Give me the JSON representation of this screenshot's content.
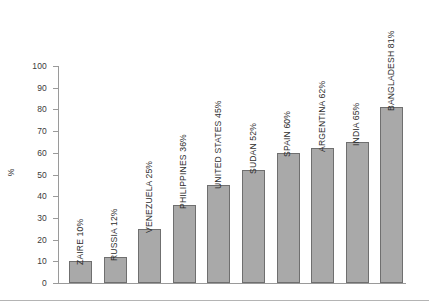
{
  "chart_data": {
    "type": "bar",
    "title": "",
    "subtitle": "",
    "xlabel": "",
    "ylabel": "%",
    "ylim": [
      0,
      100
    ],
    "ytick_step": 10,
    "yticks": [
      100,
      90,
      80,
      70,
      60,
      50,
      40,
      30,
      20,
      10,
      0
    ],
    "grid": false,
    "legend": null,
    "categories": [
      "ZAIRE",
      "RUSSIA",
      "VENEZUELA",
      "PHILIPPINES",
      "UNITED STATES",
      "SUDAN",
      "SPAIN",
      "ARGENTINA",
      "INDIA",
      "BANGLADESH"
    ],
    "values": [
      10,
      12,
      25,
      36,
      45,
      52,
      60,
      62,
      65,
      81
    ],
    "bar_labels": [
      "ZAIRE 10%",
      "RUSSIA 12%",
      "VENEZUELA 25%",
      "PHILIPPINES 36%",
      "UNITED STATES 45%",
      "SUDAN 52%",
      "SPAIN 60%",
      "ARGENTINA 62%",
      "INDIA 65%",
      "BANGLADESH 81%"
    ],
    "bar_color": "#a9a9a9",
    "bar_outline_color": "#6f6f6f",
    "axis_color": "#9a9a9a",
    "text_color": "#2e2e2e"
  }
}
